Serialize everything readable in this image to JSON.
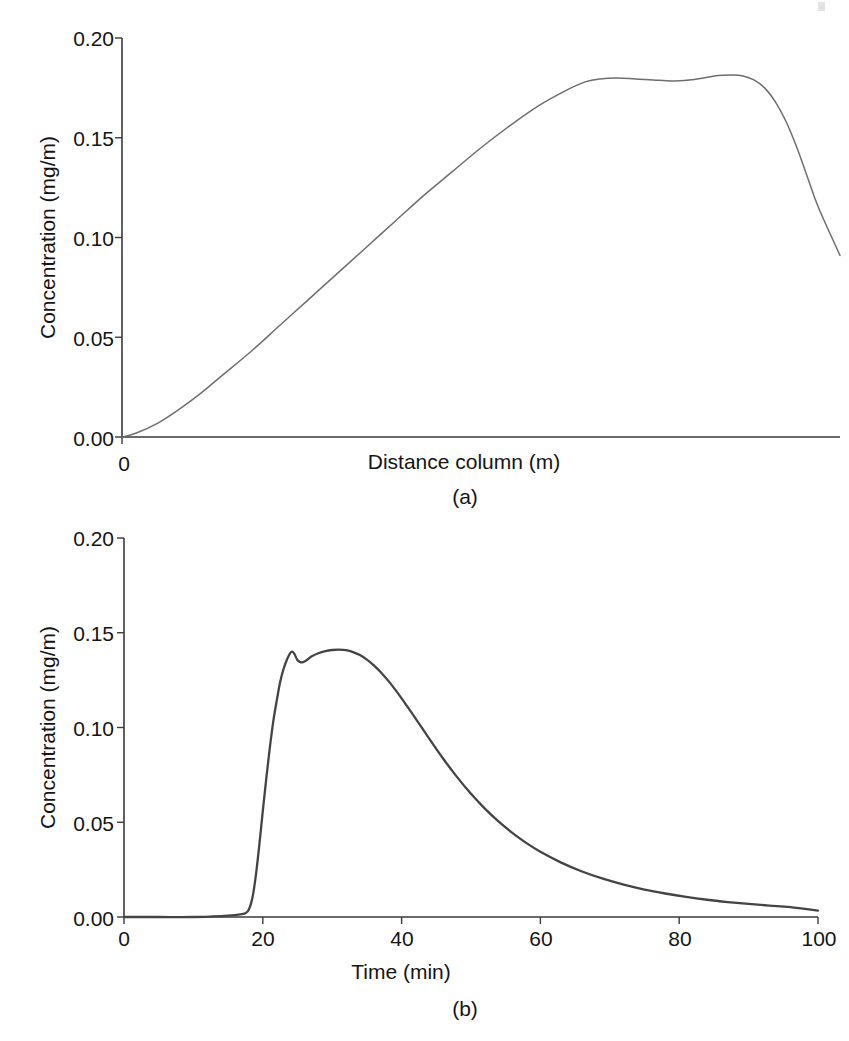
{
  "figure": {
    "background_color": "#ffffff",
    "axis_color": "#3a3a3a"
  },
  "panel_a": {
    "caption": "(a)",
    "ylabel": "Concentration (mg/m",
    "ylabel_full": "Concentration (mg/m)",
    "xlabel": "Distance column (m)",
    "yticks": [
      "0.20",
      "0.15",
      "0.10",
      "0.05",
      "0.00"
    ],
    "xticks": [
      "0"
    ],
    "curve_color": "#6e6e6e"
  },
  "panel_b": {
    "caption": "(b)",
    "ylabel": "Concentration (mg/m",
    "ylabel_full": "Concentration (mg/m)",
    "xlabel": "Time (min)",
    "yticks": [
      "0.20",
      "0.15",
      "0.10",
      "0.05",
      "0.00"
    ],
    "xticks": [
      "0",
      "20",
      "40",
      "60",
      "80",
      "100"
    ],
    "curve_color": "#444444"
  },
  "chart_data": [
    {
      "type": "line",
      "panel": "(a)",
      "title": "",
      "xlabel": "Distance column (m)",
      "ylabel": "Concentration (mg/m)",
      "xlim": [
        0,
        1
      ],
      "ylim": [
        0.0,
        0.2
      ],
      "ytick_values": [
        0.0,
        0.05,
        0.1,
        0.15,
        0.2
      ],
      "xtick_values": [
        0
      ],
      "grid": false,
      "legend": null,
      "series": [
        {
          "name": "Concentration profile along column",
          "x": [
            0.0,
            0.02,
            0.05,
            0.08,
            0.11,
            0.14,
            0.18,
            0.22,
            0.26,
            0.3,
            0.34,
            0.38,
            0.42,
            0.46,
            0.5,
            0.54,
            0.58,
            0.62,
            0.645,
            0.665,
            0.69,
            0.715,
            0.74,
            0.765,
            0.79,
            0.81,
            0.83,
            0.85,
            0.865,
            0.88,
            0.895,
            0.91,
            0.925,
            0.94,
            0.955,
            0.97,
            1.0
          ],
          "y": [
            0.0,
            0.002,
            0.007,
            0.014,
            0.022,
            0.031,
            0.043,
            0.056,
            0.069,
            0.082,
            0.095,
            0.108,
            0.121,
            0.133,
            0.145,
            0.156,
            0.166,
            0.174,
            0.178,
            0.1795,
            0.18,
            0.1795,
            0.179,
            0.1785,
            0.179,
            0.18,
            0.1812,
            0.1815,
            0.181,
            0.179,
            0.175,
            0.168,
            0.158,
            0.145,
            0.13,
            0.115,
            0.091
          ]
        }
      ]
    },
    {
      "type": "line",
      "panel": "(b)",
      "title": "",
      "xlabel": "Time (min)",
      "ylabel": "Concentration (mg/m)",
      "xlim": [
        0,
        100
      ],
      "ylim": [
        0.0,
        0.2
      ],
      "ytick_values": [
        0.0,
        0.05,
        0.1,
        0.15,
        0.2
      ],
      "xtick_values": [
        0,
        20,
        40,
        60,
        80,
        100
      ],
      "grid": false,
      "legend": null,
      "series": [
        {
          "name": "Breakthrough curve at column exit",
          "x": [
            0,
            5,
            10,
            14,
            16,
            17,
            17.5,
            18,
            18.5,
            19,
            19.5,
            20,
            20.5,
            21,
            21.5,
            22,
            22.5,
            23,
            23.5,
            24,
            24.3,
            24.6,
            25,
            25.4,
            25.8,
            26.3,
            27,
            28,
            29,
            30,
            31,
            32,
            33,
            34,
            35,
            36,
            37,
            38,
            39,
            40,
            42,
            44,
            46,
            48,
            50,
            52,
            54,
            56,
            58,
            60,
            63,
            66,
            69,
            72,
            75,
            78,
            81,
            84,
            87,
            90,
            93,
            96,
            100
          ],
          "y": [
            0.0,
            0.0,
            0.0,
            0.0005,
            0.001,
            0.0015,
            0.002,
            0.004,
            0.01,
            0.022,
            0.038,
            0.056,
            0.073,
            0.089,
            0.103,
            0.114,
            0.124,
            0.131,
            0.136,
            0.1395,
            0.14,
            0.1385,
            0.1355,
            0.1345,
            0.1345,
            0.1355,
            0.1375,
            0.1392,
            0.1403,
            0.1409,
            0.1411,
            0.1408,
            0.1398,
            0.1382,
            0.1358,
            0.1328,
            0.1292,
            0.125,
            0.1204,
            0.1154,
            0.1048,
            0.094,
            0.0835,
            0.0738,
            0.065,
            0.0572,
            0.0503,
            0.0443,
            0.039,
            0.0344,
            0.0287,
            0.024,
            0.0202,
            0.0171,
            0.0145,
            0.0124,
            0.0106,
            0.0091,
            0.0079,
            0.0069,
            0.006,
            0.0052,
            0.0034
          ]
        }
      ]
    }
  ]
}
